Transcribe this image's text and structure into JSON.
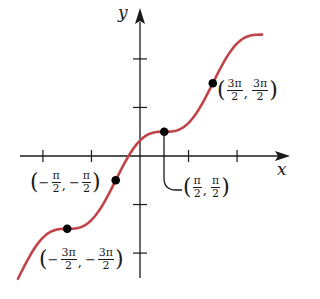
{
  "chart_data": {
    "type": "line",
    "title": "",
    "function": "y = x + cos x",
    "xlabel": "x",
    "ylabel": "y",
    "xlim": [
      -7.9,
      9.8
    ],
    "ylim": [
      -7.9,
      9.4
    ],
    "grid": false,
    "legend": null,
    "x_ticks_labels": [],
    "x_ticks_positions": [
      -6.283,
      -3.1416,
      3.1416,
      6.283
    ],
    "y_ticks_positions": [
      -6.283,
      -3.1416,
      3.1416,
      6.283
    ],
    "series": [
      {
        "name": "y = x + cos x",
        "color": "#c0444a",
        "x_range": [
          -7.9,
          7.9
        ]
      }
    ],
    "marked_points": [
      {
        "x": -4.712,
        "y": -4.712,
        "label": "(−3π/2, −3π/2)"
      },
      {
        "x": -1.571,
        "y": -1.571,
        "label": "(−π/2, −π/2)"
      },
      {
        "x": 1.571,
        "y": 1.571,
        "label": "(π/2, π/2)"
      },
      {
        "x": 4.712,
        "y": 4.712,
        "label": "(3π/2, 3π/2)"
      }
    ]
  },
  "axes": {
    "x_label": "x",
    "y_label": "y"
  },
  "annotations": {
    "p1": {
      "sign": "",
      "num_x": "3π",
      "den_x": "2",
      "num_y": "3π",
      "den_y": "2"
    },
    "p2": {
      "sign": "",
      "num_x": "π",
      "den_x": "2",
      "num_y": "π",
      "den_y": "2"
    },
    "p3": {
      "sign": "−",
      "num_x": "π",
      "den_x": "2",
      "num_y": "π",
      "den_y": "2"
    },
    "p4": {
      "sign": "−",
      "num_x": "3π",
      "den_x": "2",
      "num_y": "3π",
      "den_y": "2"
    },
    "open": "(",
    "close": ")",
    "comma": ","
  },
  "style": {
    "curve_color": "#c0444a",
    "axis_color": "#1a1a1a",
    "point_color": "#000000"
  }
}
